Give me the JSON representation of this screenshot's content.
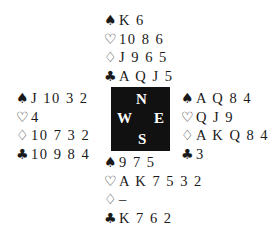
{
  "suits": {
    "spades": "♠",
    "hearts": "♡",
    "diamonds": "♢",
    "clubs": "♣"
  },
  "compass": {
    "north": "N",
    "south": "S",
    "east": "E",
    "west": "W"
  },
  "hands": {
    "north": {
      "spades": "K 6",
      "hearts": "10 8 6",
      "diamonds": "J 9 6 5",
      "clubs": "A Q J 5"
    },
    "west": {
      "spades": "J 10 3 2",
      "hearts": "4",
      "diamonds": "10 7 3 2",
      "clubs": "10 9 8 4"
    },
    "east": {
      "spades": "A Q 8 4",
      "hearts": "Q J 9",
      "diamonds": "A K Q 8 4",
      "clubs": "3"
    },
    "south": {
      "spades": "9 7 5",
      "hearts": "A K 7 5 3 2",
      "diamonds": "–",
      "clubs": "K 7 6 2"
    }
  }
}
